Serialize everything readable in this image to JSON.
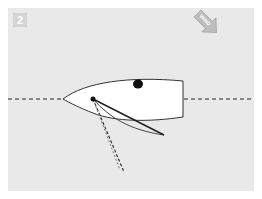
{
  "step": {
    "number": "2"
  },
  "wind": {
    "label": "WIND",
    "direction": "from top-right to bottom-left"
  },
  "colors": {
    "background": "#e9e9e9",
    "hull_fill": "#ffffff",
    "outline": "#333333",
    "dashed_line": "#555555",
    "wind_arrow": "#bdbdbd",
    "badge": "#d4d4d4"
  },
  "elements": {
    "centerline": "dashed horizontal course line",
    "hull": "dinghy hull viewed from above",
    "crew": "crew position dot",
    "mast": "mast point",
    "boom": "boom line",
    "sail": "sail curve",
    "previous_boom_positions": "dashed boom positions"
  }
}
